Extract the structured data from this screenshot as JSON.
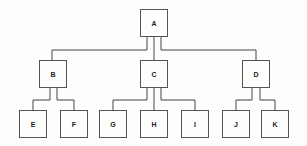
{
  "diagram": {
    "type": "tree",
    "nodes": {
      "A": {
        "label": "A"
      },
      "B": {
        "label": "B"
      },
      "C": {
        "label": "C"
      },
      "D": {
        "label": "D"
      },
      "E": {
        "label": "E"
      },
      "F": {
        "label": "F"
      },
      "G": {
        "label": "G"
      },
      "H": {
        "label": "H"
      },
      "I": {
        "label": "I"
      },
      "J": {
        "label": "J"
      },
      "K": {
        "label": "K"
      }
    },
    "edges": [
      [
        "A",
        "B"
      ],
      [
        "A",
        "C"
      ],
      [
        "A",
        "D"
      ],
      [
        "B",
        "E"
      ],
      [
        "B",
        "F"
      ],
      [
        "C",
        "G"
      ],
      [
        "C",
        "H"
      ],
      [
        "C",
        "I"
      ],
      [
        "D",
        "J"
      ],
      [
        "D",
        "K"
      ]
    ]
  }
}
